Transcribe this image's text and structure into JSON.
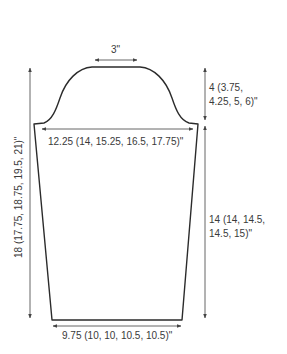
{
  "diagram": {
    "type": "knitting schematic - sleeve",
    "labels": {
      "cap_top_width": "3\"",
      "cap_height_line1": "4 (3.75,",
      "cap_height_line2": "4.25, 5, 6)\"",
      "upper_arm_width": "12.25 (14, 15.25, 16.5, 17.75)\"",
      "sleeve_length_line1": "14 (14, 14.5,",
      "sleeve_length_line2": "14.5, 15)\"",
      "total_length": "18 (17.75, 18.75, 19.5, 21)\"",
      "cuff_width": "9.75 (10, 10, 10.5, 10.5)\""
    },
    "colors": {
      "outline": "#2b2b2b",
      "dimension_line": "#555555",
      "background": "#ffffff"
    }
  }
}
